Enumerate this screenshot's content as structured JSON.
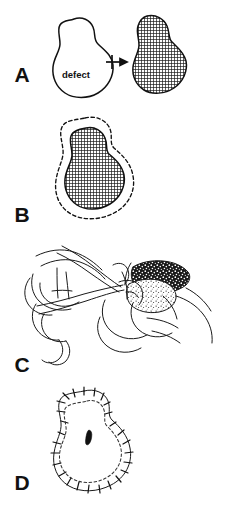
{
  "figure": {
    "background_color": "#ffffff",
    "ink_color": "#111111",
    "width": 237,
    "height": 511
  },
  "panels": [
    {
      "id": "A",
      "label": "A",
      "label_x": 22,
      "label_y": 82,
      "caption": "Defect template transferred to donor site pattern",
      "annotation": "defect",
      "annotation_x": 76,
      "annotation_y": 78,
      "arrow": "right-arrow-icon",
      "shapes": [
        {
          "name": "defect-outline",
          "style": "solid",
          "fill": "none"
        },
        {
          "name": "graft-template",
          "style": "solid",
          "fill": "cross-hatch"
        }
      ]
    },
    {
      "id": "B",
      "label": "B",
      "label_x": 22,
      "label_y": 222,
      "caption": "Graft template outlined with surrounding dashed incision margin",
      "shapes": [
        {
          "name": "incision-margin",
          "style": "dashed",
          "fill": "none"
        },
        {
          "name": "graft-template",
          "style": "solid",
          "fill": "cross-hatch"
        }
      ]
    },
    {
      "id": "C",
      "label": "C",
      "label_x": 22,
      "label_y": 372,
      "caption": "Defatting the graft held over the surgeon's finger with scissors",
      "shapes": [
        {
          "name": "surgeon-hands",
          "style": "line-art",
          "fill": "none"
        },
        {
          "name": "scissors",
          "style": "line-art",
          "fill": "none"
        },
        {
          "name": "graft-dermal-side",
          "style": "line-art",
          "fill": "stipple"
        }
      ]
    },
    {
      "id": "D",
      "label": "D",
      "label_x": 22,
      "label_y": 490,
      "caption": "Graft sutured into the defect with interrupted peripheral sutures",
      "shapes": [
        {
          "name": "suture-line",
          "style": "solid-with-ticks",
          "fill": "none"
        },
        {
          "name": "graft-margin",
          "style": "dashed",
          "fill": "none"
        },
        {
          "name": "central-slit",
          "style": "solid",
          "fill": "solid-black"
        }
      ]
    }
  ],
  "legend": {
    "cross_hatch_meaning": "graft template",
    "dashed_meaning": "incision / margin line",
    "stipple_meaning": "dermal fat surface",
    "tick_meaning": "interrupted suture"
  }
}
